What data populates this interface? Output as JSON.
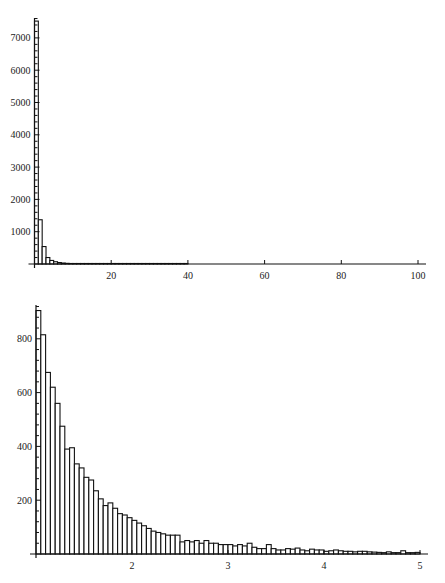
{
  "chart_data": [
    {
      "type": "bar",
      "title": "",
      "xlabel": "",
      "ylabel": "",
      "xlim": [
        0,
        100
      ],
      "ylim": [
        0,
        7600
      ],
      "bin_width": 1,
      "bin_start": 0,
      "x_ticks": [
        20,
        40,
        60,
        80,
        100
      ],
      "y_ticks": [
        1000,
        2000,
        3000,
        4000,
        5000,
        6000,
        7000
      ],
      "grid": false,
      "values": [
        7520,
        1370,
        540,
        200,
        110,
        70,
        45,
        30,
        20,
        15,
        12,
        10,
        8,
        7,
        6,
        5,
        4,
        4,
        3,
        3,
        3,
        2,
        2,
        2,
        2,
        2,
        1,
        1,
        1,
        1,
        1,
        1,
        1,
        1,
        1,
        1,
        1,
        1,
        1,
        1
      ]
    },
    {
      "type": "bar",
      "title": "",
      "xlabel": "",
      "ylabel": "",
      "xlim": [
        1,
        5
      ],
      "ylim": [
        0,
        920
      ],
      "bin_width": 0.05,
      "bin_start": 1,
      "x_ticks": [
        2,
        3,
        4,
        5
      ],
      "y_ticks": [
        200,
        400,
        600,
        800
      ],
      "grid": false,
      "values": [
        905,
        815,
        675,
        620,
        560,
        475,
        390,
        395,
        335,
        320,
        285,
        275,
        235,
        205,
        180,
        190,
        170,
        150,
        145,
        135,
        125,
        115,
        105,
        95,
        85,
        80,
        75,
        70,
        70,
        70,
        45,
        50,
        45,
        50,
        40,
        50,
        40,
        40,
        35,
        35,
        35,
        30,
        35,
        30,
        40,
        25,
        20,
        20,
        35,
        20,
        15,
        15,
        20,
        18,
        22,
        15,
        12,
        18,
        15,
        15,
        10,
        12,
        15,
        12,
        10,
        10,
        8,
        10,
        10,
        8,
        7,
        6,
        5,
        8,
        5,
        5,
        12,
        5,
        5,
        6
      ]
    }
  ],
  "top_chart": {
    "x_tick_labels": [
      "20",
      "40",
      "60",
      "80",
      "100"
    ],
    "y_tick_labels": [
      "1000",
      "2000",
      "3000",
      "4000",
      "5000",
      "6000",
      "7000"
    ]
  },
  "bottom_chart": {
    "x_tick_labels": [
      "2",
      "3",
      "4",
      "5"
    ],
    "y_tick_labels": [
      "200",
      "400",
      "600",
      "800"
    ]
  }
}
